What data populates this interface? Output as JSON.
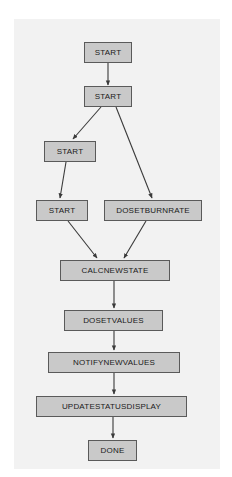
{
  "diagram": {
    "type": "flowchart",
    "background_color": "#ffffff",
    "surface_color": "#f2f2f2",
    "node_fill_color": "#c9c9c9",
    "node_border_color": "#5a5a5a",
    "edge_color": "#3a3a3a",
    "text_color": "#1a1a1a",
    "nodes": [
      {
        "id": "start1",
        "label": "START",
        "x": 84,
        "y": 42,
        "w": 48,
        "h": 21
      },
      {
        "id": "start2",
        "label": "START",
        "x": 84,
        "y": 86,
        "w": 48,
        "h": 21
      },
      {
        "id": "start3",
        "label": "START",
        "x": 44,
        "y": 141,
        "w": 52,
        "h": 21
      },
      {
        "id": "start4",
        "label": "START",
        "x": 36,
        "y": 200,
        "w": 52,
        "h": 21
      },
      {
        "id": "dosetburnrate",
        "label": "DOSETBURNRATE",
        "x": 104,
        "y": 200,
        "w": 98,
        "h": 21
      },
      {
        "id": "calcnewstate",
        "label": "CALCNEWSTATE",
        "x": 60,
        "y": 260,
        "w": 110,
        "h": 21
      },
      {
        "id": "dosetvalues",
        "label": "DOSETVALUES",
        "x": 64,
        "y": 310,
        "w": 99,
        "h": 21
      },
      {
        "id": "notifynewvalues",
        "label": "NOTIFYNEWVALUES",
        "x": 48,
        "y": 352,
        "w": 132,
        "h": 21
      },
      {
        "id": "updatestatusdisplay",
        "label": "UPDATESTATUSDISPLAY",
        "x": 36,
        "y": 396,
        "w": 151,
        "h": 21
      },
      {
        "id": "done",
        "label": "DONE",
        "x": 88,
        "y": 440,
        "w": 49,
        "h": 21
      }
    ],
    "edges": [
      {
        "from": "start1",
        "to": "start2",
        "x1": 108,
        "y1": 63,
        "x2": 108,
        "y2": 85
      },
      {
        "from": "start2",
        "to": "start3",
        "x1": 101,
        "y1": 107,
        "x2": 73,
        "y2": 139
      },
      {
        "from": "start2",
        "to": "dosetburnrate",
        "x1": 116,
        "y1": 107,
        "x2": 152,
        "y2": 198
      },
      {
        "from": "start3",
        "to": "start4",
        "x1": 66,
        "y1": 162,
        "x2": 60,
        "y2": 198
      },
      {
        "from": "start4",
        "to": "calcnewstate",
        "x1": 68,
        "y1": 221,
        "x2": 97,
        "y2": 258
      },
      {
        "from": "dosetburnrate",
        "to": "calcnewstate",
        "x1": 146,
        "y1": 221,
        "x2": 124,
        "y2": 258
      },
      {
        "from": "calcnewstate",
        "to": "dosetvalues",
        "x1": 114,
        "y1": 281,
        "x2": 114,
        "y2": 308
      },
      {
        "from": "dosetvalues",
        "to": "notifynewvalues",
        "x1": 114,
        "y1": 331,
        "x2": 114,
        "y2": 350
      },
      {
        "from": "notifynewvalues",
        "to": "updatestatusdisplay",
        "x1": 114,
        "y1": 373,
        "x2": 114,
        "y2": 394
      },
      {
        "from": "updatestatusdisplay",
        "to": "done",
        "x1": 113,
        "y1": 417,
        "x2": 113,
        "y2": 438
      }
    ]
  }
}
